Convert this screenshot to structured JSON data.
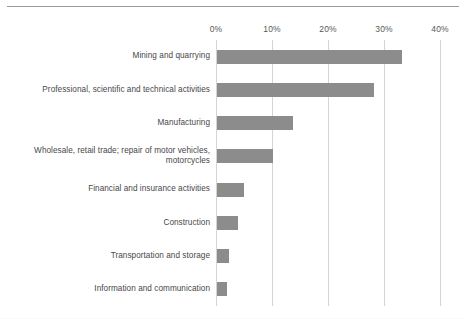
{
  "chart_data": {
    "type": "bar",
    "orientation": "horizontal",
    "title": "",
    "subtitle": "",
    "xlabel": "",
    "ylabel": "",
    "xlim": [
      0,
      40
    ],
    "x_tick_labels": [
      "0%",
      "10%",
      "20%",
      "30%",
      "40%"
    ],
    "x_tick_values": [
      0,
      10,
      20,
      30,
      40
    ],
    "grid": true,
    "legend": false,
    "legend_position": "none",
    "bar_color": "#8c8c8c",
    "gridline_color": "#d4d4d4",
    "categories": [
      "Mining and quarrying",
      "Professional, scientific and technical activities",
      "Manufacturing",
      "Wholesale, retail trade; repair of motor vehicles, motorcycles",
      "Financial and insurance activities",
      "Construction",
      "Transportation and storage",
      "Information and communication"
    ],
    "values": [
      33.0,
      28.0,
      13.5,
      10.0,
      4.8,
      3.8,
      2.2,
      1.8
    ],
    "value_unit": "%"
  },
  "axis": {
    "ticks": [
      {
        "label": "0%",
        "value": 0
      },
      {
        "label": "10%",
        "value": 10
      },
      {
        "label": "20%",
        "value": 20
      },
      {
        "label": "30%",
        "value": 30
      },
      {
        "label": "40%",
        "value": 40
      }
    ]
  },
  "bars": [
    {
      "label": "Mining and quarrying",
      "value": 33.0
    },
    {
      "label": "Professional, scientific and technical activities",
      "value": 28.0
    },
    {
      "label": "Manufacturing",
      "value": 13.5
    },
    {
      "label": "Wholesale, retail trade; repair of motor vehicles, motorcycles",
      "value": 10.0
    },
    {
      "label": "Financial and insurance activities",
      "value": 4.8
    },
    {
      "label": "Construction",
      "value": 3.8
    },
    {
      "label": "Transportation and storage",
      "value": 2.2
    },
    {
      "label": "Information and communication",
      "value": 1.8
    }
  ]
}
